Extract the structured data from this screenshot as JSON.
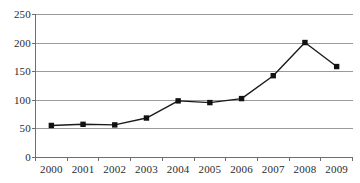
{
  "chart_data": {
    "type": "line",
    "title": "",
    "xlabel": "",
    "ylabel": "",
    "categories": [
      "2000",
      "2001",
      "2002",
      "2003",
      "2004",
      "2005",
      "2006",
      "2007",
      "2008",
      "2009"
    ],
    "values": [
      56,
      58,
      57,
      69,
      99,
      96,
      103,
      143,
      201,
      159
    ],
    "series": [
      {
        "name": "series-1",
        "values": [
          56,
          58,
          57,
          69,
          99,
          96,
          103,
          143,
          201,
          159
        ]
      }
    ],
    "ylim": [
      0,
      250
    ],
    "ytick_labels": [
      "0",
      "50",
      "100",
      "150",
      "200",
      "250"
    ],
    "ytick_values": [
      0,
      50,
      100,
      150,
      200,
      250
    ],
    "grid": "horizontal",
    "legend": "none",
    "marker": "square",
    "line_color": "#1a1a1a",
    "marker_color": "#111111",
    "grid_color": "#9a9a9a",
    "axis_color": "#6f6f6f"
  },
  "artifacts": {
    "clipped_top_caption": ""
  }
}
